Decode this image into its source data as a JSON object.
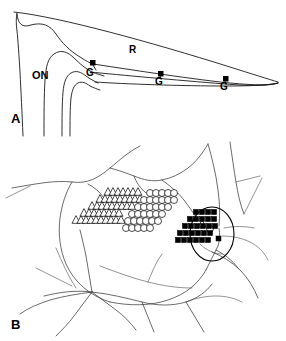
{
  "figure": {
    "panels": [
      {
        "id": "A",
        "label": "A",
        "description": "Schematic sagittal section of optic nerve head and retina with three ganglion cell recording sites",
        "annotations": [
          {
            "name": "optic-nerve",
            "text": "ON"
          },
          {
            "name": "retina",
            "text": "R"
          },
          {
            "name": "ganglion-site-1",
            "text": "G"
          },
          {
            "name": "ganglion-site-2",
            "text": "G"
          },
          {
            "name": "ganglion-site-3",
            "text": "G"
          }
        ]
      },
      {
        "id": "B",
        "label": "B",
        "description": "Retinal fundus map showing receptive field clusters and optic disc",
        "clusters": [
          {
            "name": "triangle-cluster",
            "symbol": "open-triangle",
            "count": 43
          },
          {
            "name": "circle-cluster",
            "symbol": "open-circle",
            "count": 42
          },
          {
            "name": "square-cluster",
            "symbol": "filled-square",
            "count": 33
          }
        ],
        "legend_in_disc": [
          {
            "symbol": "open-triangle"
          },
          {
            "symbol": "open-circle"
          },
          {
            "symbol": "filled-square"
          }
        ]
      }
    ],
    "colors": {
      "ink": "#000000",
      "line": "#1a1a1a",
      "vessel": "#3a3a3a",
      "background": "#ffffff"
    }
  },
  "chart_data": {
    "type": "scatter",
    "title": "",
    "xlabel": "",
    "ylabel": "",
    "series": [
      {
        "name": "open-triangle",
        "marker": "triangle-open",
        "points": [
          [
            108,
            52
          ],
          [
            113,
            52
          ],
          [
            118,
            52
          ],
          [
            123,
            52
          ],
          [
            128,
            52
          ],
          [
            133,
            52
          ],
          [
            138,
            52
          ],
          [
            100,
            59
          ],
          [
            105,
            59
          ],
          [
            110,
            59
          ],
          [
            115,
            59
          ],
          [
            120,
            59
          ],
          [
            125,
            59
          ],
          [
            130,
            59
          ],
          [
            135,
            59
          ],
          [
            140,
            59
          ],
          [
            92,
            66
          ],
          [
            97,
            66
          ],
          [
            102,
            66
          ],
          [
            107,
            66
          ],
          [
            112,
            66
          ],
          [
            117,
            66
          ],
          [
            122,
            66
          ],
          [
            127,
            66
          ],
          [
            132,
            66
          ],
          [
            84,
            73
          ],
          [
            89,
            73
          ],
          [
            94,
            73
          ],
          [
            99,
            73
          ],
          [
            104,
            73
          ],
          [
            109,
            73
          ],
          [
            114,
            73
          ],
          [
            119,
            73
          ],
          [
            76,
            80
          ],
          [
            81,
            80
          ],
          [
            86,
            80
          ],
          [
            91,
            80
          ],
          [
            96,
            80
          ],
          [
            101,
            80
          ],
          [
            106,
            80
          ],
          [
            111,
            80
          ],
          [
            116,
            80
          ],
          [
            121,
            80
          ]
        ]
      },
      {
        "name": "open-circle",
        "marker": "circle-open",
        "points": [
          [
            150,
            53
          ],
          [
            156,
            53
          ],
          [
            162,
            53
          ],
          [
            168,
            53
          ],
          [
            174,
            53
          ],
          [
            144,
            60
          ],
          [
            150,
            60
          ],
          [
            156,
            60
          ],
          [
            162,
            60
          ],
          [
            168,
            60
          ],
          [
            174,
            60
          ],
          [
            138,
            67
          ],
          [
            144,
            67
          ],
          [
            150,
            67
          ],
          [
            156,
            67
          ],
          [
            162,
            67
          ],
          [
            168,
            67
          ],
          [
            132,
            74
          ],
          [
            138,
            74
          ],
          [
            144,
            74
          ],
          [
            150,
            74
          ],
          [
            156,
            74
          ],
          [
            162,
            74
          ],
          [
            128,
            81
          ],
          [
            134,
            81
          ],
          [
            140,
            81
          ],
          [
            146,
            81
          ],
          [
            152,
            81
          ],
          [
            158,
            81
          ],
          [
            126,
            88
          ],
          [
            132,
            88
          ],
          [
            138,
            88
          ],
          [
            144,
            88
          ],
          [
            150,
            88
          ]
        ]
      },
      {
        "name": "filled-square",
        "marker": "square-filled",
        "points": [
          [
            196,
            72
          ],
          [
            202,
            72
          ],
          [
            208,
            72
          ],
          [
            214,
            72
          ],
          [
            190,
            79
          ],
          [
            196,
            79
          ],
          [
            202,
            79
          ],
          [
            208,
            79
          ],
          [
            214,
            79
          ],
          [
            185,
            86
          ],
          [
            191,
            86
          ],
          [
            197,
            86
          ],
          [
            203,
            86
          ],
          [
            209,
            86
          ],
          [
            215,
            86
          ],
          [
            180,
            93
          ],
          [
            186,
            93
          ],
          [
            192,
            93
          ],
          [
            198,
            93
          ],
          [
            204,
            93
          ],
          [
            210,
            93
          ],
          [
            178,
            100
          ],
          [
            184,
            100
          ],
          [
            190,
            100
          ],
          [
            196,
            100
          ],
          [
            202,
            100
          ],
          [
            208,
            100
          ]
        ]
      }
    ]
  }
}
